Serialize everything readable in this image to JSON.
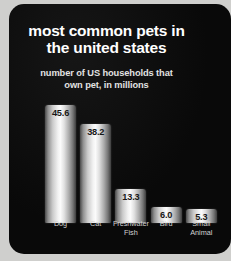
{
  "chart_data": {
    "type": "bar",
    "title": "most common pets in the united states",
    "title_line_1": "most common pets in",
    "title_line_2": "the united states",
    "subtitle": "number of US households that own pet, in millions",
    "subtitle_line_1": "number of US households that",
    "subtitle_line_2": "own pet, in millions",
    "xlabel": "",
    "ylabel": "number of US households (millions)",
    "ylim": [
      0,
      50
    ],
    "grid": false,
    "legend": "none",
    "categories": [
      "Dog",
      "Cat",
      "Freshwater Fish",
      "Bird",
      "Small Animal"
    ],
    "values": [
      45.6,
      38.2,
      13.3,
      6.0,
      5.3
    ],
    "bars": [
      {
        "label": "Dog",
        "label_line_1": "Dog",
        "label_line_2": "",
        "value": 45.6,
        "value_text": "45.6"
      },
      {
        "label": "Cat",
        "label_line_1": "Cat",
        "label_line_2": "",
        "value": 38.2,
        "value_text": "38.2"
      },
      {
        "label": "Freshwater Fish",
        "label_line_1": "Freshwater",
        "label_line_2": "Fish",
        "value": 13.3,
        "value_text": "13.3"
      },
      {
        "label": "Bird",
        "label_line_1": "Bird",
        "label_line_2": "",
        "value": 6.0,
        "value_text": "6.0"
      },
      {
        "label": "Small Animal",
        "label_line_1": "Small",
        "label_line_2": "Animal",
        "value": 5.3,
        "value_text": "5.3"
      }
    ]
  },
  "colors": {
    "panel_background": "#0a0a0a",
    "page_background": "#cfcfcd",
    "title_text": "#ffffff",
    "subtitle_text": "#e2e2e2",
    "category_label_text": "#d2d2d2",
    "bar_value_text": "#171717",
    "bar_highlight": "#fbfbfb",
    "bar_shadow": "#3d3d3d"
  }
}
